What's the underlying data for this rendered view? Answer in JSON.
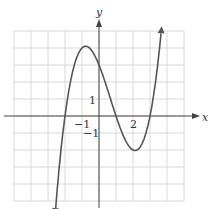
{
  "chart_data": {
    "type": "line",
    "title": "",
    "xlabel": "x",
    "ylabel": "y",
    "function": "f(x) = 0.5(x+2)(x-1)(x-3)",
    "xlim": [
      -5,
      5
    ],
    "ylim": [
      -5,
      5
    ],
    "grid": true,
    "tick_labels": {
      "x": [
        "-1",
        "2"
      ],
      "y": [
        "1",
        "-1"
      ]
    },
    "series": [
      {
        "name": "f(x)",
        "x": [
          -2.6,
          -2,
          -1,
          -0.7,
          0,
          1,
          2,
          2.1,
          3,
          3.7
        ],
        "y": [
          -4.6,
          0,
          4,
          4.1,
          3,
          0,
          -2,
          -2.0,
          0,
          4.0
        ]
      }
    ],
    "color": "#555555"
  },
  "labels": {
    "x_axis": "x",
    "y_axis": "y",
    "x_neg1": "−1",
    "x_2": "2",
    "y_1": "1",
    "y_neg1": "−1"
  }
}
